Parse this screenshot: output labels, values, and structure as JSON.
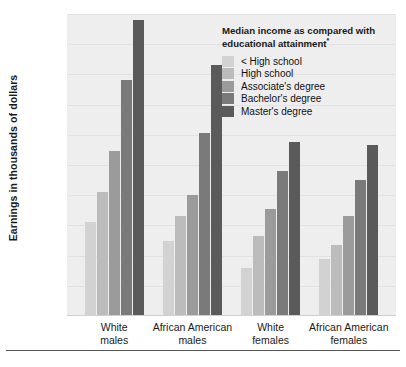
{
  "chart_data": {
    "type": "bar",
    "title": "",
    "xlabel": "",
    "ylabel": "Earnings in thousands of dollars",
    "ylim": [
      0,
      100
    ],
    "ytick_labels": [
      "$0",
      "$10",
      "$20",
      "$30",
      "$40",
      "$50",
      "$60",
      "$70",
      "$80",
      "$90",
      "$100"
    ],
    "ytick_values": [
      0,
      10,
      20,
      30,
      40,
      50,
      60,
      70,
      80,
      90,
      100
    ],
    "grid": true,
    "legend_position": "top-right",
    "legend_title": "Median income as compared with educational attainment",
    "legend_title_footnote": "*",
    "categories": [
      "White males",
      "African American males",
      "White females",
      "African American females"
    ],
    "category_lines": [
      [
        "White",
        "males"
      ],
      [
        "African American",
        "males"
      ],
      [
        "White",
        "females"
      ],
      [
        "African American",
        "females"
      ]
    ],
    "series": [
      {
        "name": "< High school",
        "color": "#d2d2d2",
        "values": [
          31,
          25,
          16,
          19
        ]
      },
      {
        "name": "High school",
        "color": "#bcbcbc",
        "values": [
          41,
          33,
          26.5,
          23.5
        ]
      },
      {
        "name": "Associate's degree",
        "color": "#9b9b9b",
        "values": [
          54.5,
          40,
          35.5,
          33
        ]
      },
      {
        "name": "Bachelor's degree",
        "color": "#7a7a7a",
        "values": [
          78,
          60.5,
          48,
          45
        ]
      },
      {
        "name": "Master's degree",
        "color": "#5a5a5a",
        "values": [
          98,
          83,
          57.5,
          56.5
        ]
      }
    ]
  }
}
